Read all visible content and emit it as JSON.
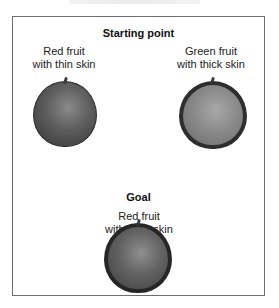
{
  "diagram": {
    "starting_point": {
      "heading": "Starting point",
      "fruits": [
        {
          "line1": "Red fruit",
          "line2": "with thin skin",
          "color": "red",
          "skin": "thin"
        },
        {
          "line1": "Green fruit",
          "line2": "with thick skin",
          "color": "green",
          "skin": "thick"
        }
      ]
    },
    "goal": {
      "heading": "Goal",
      "fruit": {
        "line1": "Red fruit",
        "line2": "with thick skin",
        "color": "red",
        "skin": "thick"
      }
    }
  }
}
